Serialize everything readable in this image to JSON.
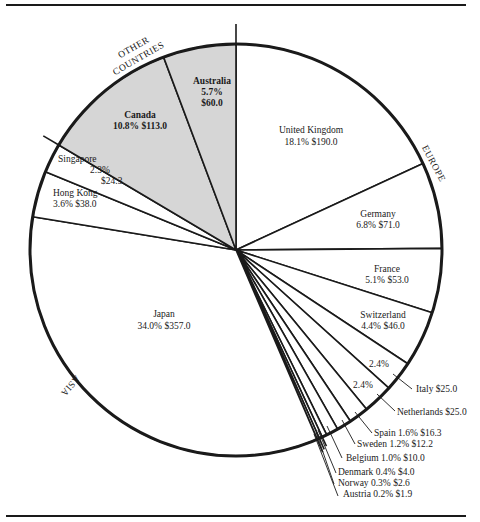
{
  "chart_data": {
    "type": "pie",
    "title": "",
    "units": "$ (value) and % of total",
    "start_angle_deg": 0,
    "direction": "clockwise",
    "regions": [
      {
        "name": "EUROPE",
        "members": [
          "United Kingdom",
          "Germany",
          "France",
          "Switzerland",
          "Italy",
          "Netherlands",
          "Spain",
          "Sweden",
          "Belgium",
          "Denmark",
          "Norway",
          "Austria"
        ]
      },
      {
        "name": "ASIA",
        "members": [
          "Japan",
          "Hong Kong",
          "Singapore"
        ]
      },
      {
        "name": "OTHER COUNTRIES",
        "members": [
          "Canada",
          "Australia"
        ]
      }
    ],
    "slices": [
      {
        "label": "United Kingdom",
        "percent": 18.1,
        "value": 190.0,
        "pct_text": "18.1%",
        "val_text": "$190.0",
        "region": "EUROPE",
        "fill": "#ffffff"
      },
      {
        "label": "Germany",
        "percent": 6.8,
        "value": 71.0,
        "pct_text": "6.8%",
        "val_text": "$71.0",
        "region": "EUROPE",
        "fill": "#ffffff"
      },
      {
        "label": "France",
        "percent": 5.1,
        "value": 53.0,
        "pct_text": "5.1%",
        "val_text": "$53.0",
        "region": "EUROPE",
        "fill": "#ffffff"
      },
      {
        "label": "Switzerland",
        "percent": 4.4,
        "value": 46.0,
        "pct_text": "4.4%",
        "val_text": "$46.0",
        "region": "EUROPE",
        "fill": "#ffffff"
      },
      {
        "label": "Italy",
        "percent": 2.4,
        "value": 25.0,
        "pct_text": "2.4%",
        "val_text": "$25.0",
        "region": "EUROPE",
        "fill": "#ffffff"
      },
      {
        "label": "Netherlands",
        "percent": 2.4,
        "value": 25.0,
        "pct_text": "2.4%",
        "val_text": "$25.0",
        "region": "EUROPE",
        "fill": "#ffffff"
      },
      {
        "label": "Spain",
        "percent": 1.6,
        "value": 16.3,
        "pct_text": "1.6%",
        "val_text": "$16.3",
        "region": "EUROPE",
        "fill": "#ffffff"
      },
      {
        "label": "Sweden",
        "percent": 1.2,
        "value": 12.2,
        "pct_text": "1.2%",
        "val_text": "$12.2",
        "region": "EUROPE",
        "fill": "#ffffff"
      },
      {
        "label": "Belgium",
        "percent": 1.0,
        "value": 10.0,
        "pct_text": "1.0%",
        "val_text": "$10.0",
        "region": "EUROPE",
        "fill": "#ffffff"
      },
      {
        "label": "Denmark",
        "percent": 0.4,
        "value": 4.0,
        "pct_text": "0.4%",
        "val_text": "$4.0",
        "region": "EUROPE",
        "fill": "#ffffff"
      },
      {
        "label": "Norway",
        "percent": 0.3,
        "value": 2.6,
        "pct_text": "0.3%",
        "val_text": "$2.6",
        "region": "EUROPE",
        "fill": "#ffffff"
      },
      {
        "label": "Austria",
        "percent": 0.2,
        "value": 1.9,
        "pct_text": "0.2%",
        "val_text": "$1.9",
        "region": "EUROPE",
        "fill": "#ffffff"
      },
      {
        "label": "Japan",
        "percent": 34.0,
        "value": 357.0,
        "pct_text": "34.0%",
        "val_text": "$357.0",
        "region": "ASIA",
        "fill": "#ffffff"
      },
      {
        "label": "Hong Kong",
        "percent": 3.6,
        "value": 38.0,
        "pct_text": "3.6%",
        "val_text": "$38.0",
        "region": "ASIA",
        "fill": "#ffffff"
      },
      {
        "label": "Singapore",
        "percent": 2.3,
        "value": 24.3,
        "pct_text": "2.3%",
        "val_text": "$24.3",
        "region": "ASIA",
        "fill": "#ffffff"
      },
      {
        "label": "Canada",
        "percent": 10.8,
        "value": 113.0,
        "pct_text": "10.8%",
        "val_text": "$113.0",
        "region": "OTHER COUNTRIES",
        "fill": "#d6d6d6"
      },
      {
        "label": "Australia",
        "percent": 5.7,
        "value": 60.0,
        "pct_text": "5.7%",
        "val_text": "$60.0",
        "region": "OTHER COUNTRIES",
        "fill": "#d6d6d6"
      }
    ],
    "region_labels": {
      "europe": "EUROPE",
      "asia": "ASIA",
      "other_line1": "OTHER",
      "other_line2": "COUNTRIES"
    },
    "colors": {
      "line": "#1a1a1a",
      "shaded": "#d6d6d6",
      "background": "#ffffff"
    }
  }
}
